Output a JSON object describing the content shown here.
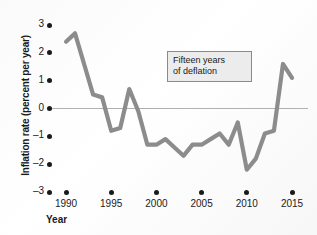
{
  "chart_data": {
    "type": "line",
    "title": "",
    "xlabel": "Year",
    "ylabel": "Inflation rate (percent per year)",
    "xlim": [
      1989,
      2016
    ],
    "ylim": [
      -3,
      3
    ],
    "grid": false,
    "legend": "none",
    "zero_line": true,
    "line_color": "#8c8c8c",
    "axis_color": "#1a1a1a",
    "x_ticks": [
      1990,
      1995,
      2000,
      2005,
      2010,
      2015
    ],
    "x_tick_labels": [
      "1990",
      "1995",
      "2000",
      "2005",
      "2010",
      "2015"
    ],
    "y_ticks": [
      3,
      2,
      1,
      0,
      -1,
      -2,
      -3
    ],
    "y_tick_labels": [
      "3",
      "2",
      "1",
      "0",
      "–1",
      "–2",
      "–3"
    ],
    "x": [
      1990,
      1991,
      1992,
      1993,
      1994,
      1995,
      1996,
      1997,
      1998,
      1999,
      2000,
      2001,
      2002,
      2003,
      2004,
      2005,
      2006,
      2007,
      2008,
      2009,
      2010,
      2011,
      2012,
      2013,
      2014,
      2015
    ],
    "values": [
      2.4,
      2.7,
      1.6,
      0.5,
      0.4,
      -0.8,
      -0.7,
      0.7,
      -0.1,
      -1.3,
      -1.3,
      -1.1,
      -1.4,
      -1.7,
      -1.3,
      -1.3,
      -1.1,
      -0.9,
      -1.3,
      -0.5,
      -2.2,
      -1.8,
      -0.9,
      -0.8,
      1.6,
      1.1
    ],
    "series_name": "Inflation rate",
    "annotations": [
      {
        "name": "deflation-callout",
        "line1": "Fifteen years",
        "line2": "of deflation",
        "x_range": [
          1998,
          2013
        ]
      }
    ]
  }
}
